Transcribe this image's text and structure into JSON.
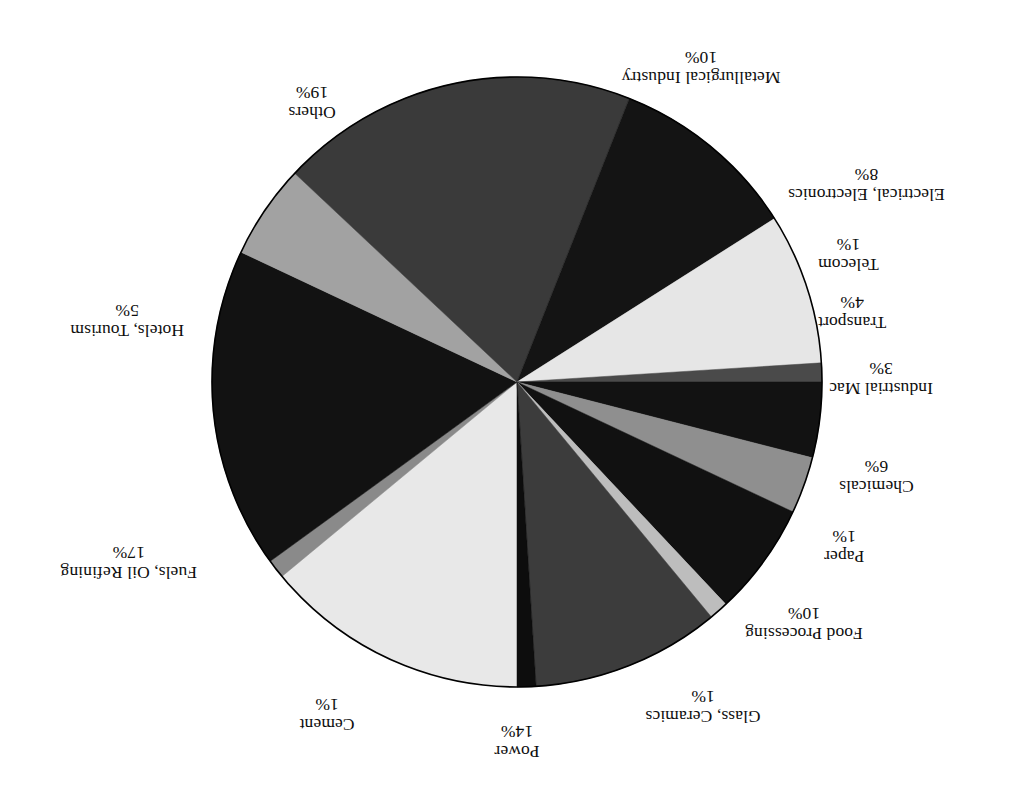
{
  "figure": {
    "orientation": "rotated-180",
    "background": "#ffffff"
  },
  "chart_data": {
    "type": "pie",
    "title": "",
    "subtitle": "",
    "xlabel": "",
    "ylabel": "",
    "legend_position": "none",
    "grid": false,
    "value_unit": "%",
    "total": 100,
    "start_angle_deg": 0,
    "direction": "clockwise",
    "categories": [
      "Power",
      "Cement",
      "Fuels, Oil Refining",
      "Hotels, Tourism",
      "Others",
      "Metallurgical Industry",
      "Electrical, Electronics",
      "Telecom",
      "Transport",
      "Industrial Mac",
      "Chemicals",
      "Paper",
      "Food Processing",
      "Glass, Ceramics"
    ],
    "values": [
      14,
      1,
      17,
      5,
      19,
      10,
      8,
      1,
      4,
      3,
      6,
      1,
      10,
      1
    ],
    "value_labels": [
      "14%",
      "1%",
      "17%",
      "5%",
      "19%",
      "10%",
      "8%",
      "1%",
      "4%",
      "3%",
      "6%",
      "1%",
      "10%",
      "1%"
    ],
    "colors": [
      "#e8e8e8",
      "#8a8a8a",
      "#121212",
      "#a2a2a2",
      "#3a3a3a",
      "#141414",
      "#e6e6e6",
      "#4a4a4a",
      "#121212",
      "#8f8f8f",
      "#111111",
      "#bdbdbd",
      "#3c3c3c",
      "#0d0d0d"
    ],
    "slices": [
      {
        "label": "Power",
        "value": 14,
        "value_label": "14%",
        "color": "#e8e8e8"
      },
      {
        "label": "Cement",
        "value": 1,
        "value_label": "1%",
        "color": "#8a8a8a"
      },
      {
        "label": "Fuels, Oil Refining",
        "value": 17,
        "value_label": "17%",
        "color": "#121212"
      },
      {
        "label": "Hotels, Tourism",
        "value": 5,
        "value_label": "5%",
        "color": "#a2a2a2"
      },
      {
        "label": "Others",
        "value": 19,
        "value_label": "19%",
        "color": "#3a3a3a"
      },
      {
        "label": "Metallurgical Industry",
        "value": 10,
        "value_label": "10%",
        "color": "#141414"
      },
      {
        "label": "Electrical, Electronics",
        "value": 8,
        "value_label": "8%",
        "color": "#e6e6e6"
      },
      {
        "label": "Telecom",
        "value": 1,
        "value_label": "1%",
        "color": "#4a4a4a"
      },
      {
        "label": "Transport",
        "value": 4,
        "value_label": "4%",
        "color": "#121212"
      },
      {
        "label": "Industrial Mac",
        "value": 3,
        "value_label": "3%",
        "color": "#8f8f8f"
      },
      {
        "label": "Chemicals",
        "value": 6,
        "value_label": "6%",
        "color": "#111111"
      },
      {
        "label": "Paper",
        "value": 1,
        "value_label": "1%",
        "color": "#bdbdbd"
      },
      {
        "label": "Food Processing",
        "value": 10,
        "value_label": "10%",
        "color": "#3c3c3c"
      },
      {
        "label": "Glass, Ceramics",
        "value": 1,
        "value_label": "1%",
        "color": "#0d0d0d"
      }
    ]
  },
  "geometry": {
    "center_x": 516,
    "center_y": 424,
    "radius": 305,
    "outline_color": "#000000"
  }
}
